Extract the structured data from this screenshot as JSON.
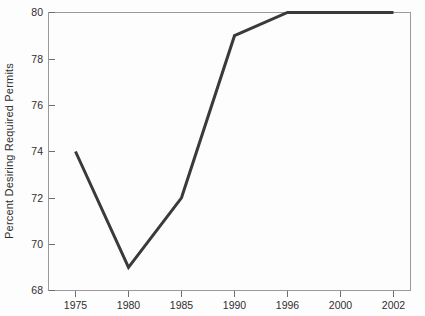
{
  "chart_data": {
    "type": "line",
    "title": "",
    "subtitle": "",
    "xlabel": "",
    "ylabel": "Percent Desiring Required Permits",
    "categories": [
      "1975",
      "1980",
      "1985",
      "1990",
      "1996",
      "2000",
      "2002"
    ],
    "values": [
      74,
      69,
      72,
      79,
      80,
      80,
      80
    ],
    "series": [
      {
        "name": "Percent Desiring Required Permits",
        "values": [
          74,
          69,
          72,
          79,
          80,
          80,
          80
        ]
      }
    ],
    "x_tick_labels": [
      "1975",
      "1980",
      "1985",
      "1990",
      "1996",
      "2000",
      "2002"
    ],
    "y_tick_labels": [
      "68",
      "70",
      "72",
      "74",
      "76",
      "78",
      "80"
    ],
    "y_ticks": [
      68,
      70,
      72,
      74,
      76,
      78,
      80
    ],
    "ylim": [
      68,
      80
    ],
    "grid": false,
    "legend": false,
    "legend_position": "none",
    "line_color": "#3a3a3a",
    "axis_color": "#9a9a9a",
    "background_color": "#fdfdfd"
  }
}
